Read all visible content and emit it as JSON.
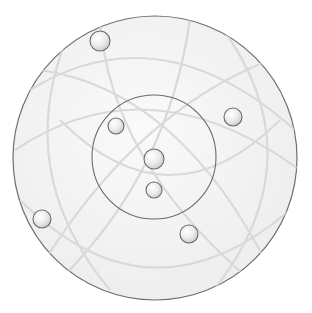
{
  "canvas": {
    "width": 312,
    "height": 313,
    "background": "#ffffff"
  },
  "colors": {
    "disc_fill": "#f2f2f2",
    "disc_stroke": "#6f6f6f",
    "inner_stroke": "#6a6a6a",
    "arc_stroke": "#d9d9d9",
    "ball_stroke": "#6a6a6a",
    "ball_light": "#ffffff",
    "ball_dark": "#cfcfcf"
  },
  "outer_circle": {
    "cx": 155,
    "cy": 158,
    "r": 142
  },
  "inner_circle": {
    "cx": 154,
    "cy": 157,
    "r": 62
  },
  "arcs": [
    {
      "d": "M 30 90 Q 160 10 295 130"
    },
    {
      "d": "M 20 200 Q 150 330 290 210"
    },
    {
      "d": "M 70 30 Q 10 170 110 290"
    },
    {
      "d": "M 220 25 Q 320 160 210 295"
    },
    {
      "d": "M 40 70 Q 180 90 270 270"
    },
    {
      "d": "M 270 60 Q 140 110 45 260"
    },
    {
      "d": "M 60 120 Q 170 230 280 120"
    },
    {
      "d": "M 100 20 Q 110 160 250 280"
    },
    {
      "d": "M 190 18 Q 170 170 60 280"
    },
    {
      "d": "M 15 150 Q 150 60 300 170"
    }
  ],
  "balls": [
    {
      "id": "ball-top-left",
      "cx": 100,
      "cy": 41,
      "r": 10
    },
    {
      "id": "ball-inner-upper-left",
      "cx": 116,
      "cy": 126,
      "r": 8
    },
    {
      "id": "ball-right",
      "cx": 233,
      "cy": 117,
      "r": 9
    },
    {
      "id": "ball-center",
      "cx": 154,
      "cy": 159,
      "r": 10
    },
    {
      "id": "ball-center-lower",
      "cx": 154,
      "cy": 190,
      "r": 8
    },
    {
      "id": "ball-left",
      "cx": 42,
      "cy": 219,
      "r": 9
    },
    {
      "id": "ball-lower-right",
      "cx": 189,
      "cy": 234,
      "r": 9
    }
  ]
}
